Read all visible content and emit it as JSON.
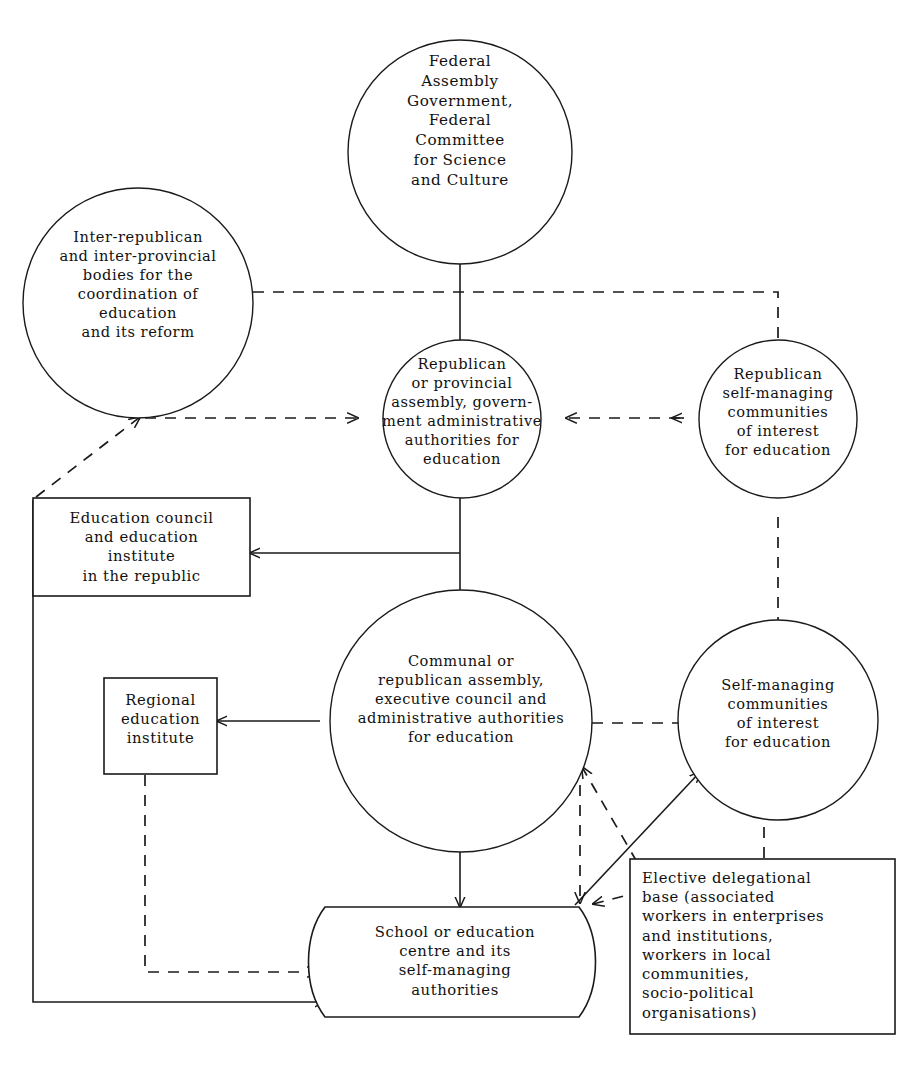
{
  "diagram": {
    "nodes": [
      {
        "id": "federal",
        "name": "federal-assembly-node",
        "shape": "circle",
        "text": "Federal\nAssembly\nGovernment,\nFederal\nCommittee\nfor Science\nand Culture"
      },
      {
        "id": "interrepublican",
        "name": "inter-republican-bodies-node",
        "shape": "circle",
        "text": "Inter-republican\nand inter-provincial\nbodies for the\ncoordination of\neducation\nand its reform"
      },
      {
        "id": "republican-assembly",
        "name": "republican-provincial-assembly-node",
        "shape": "circle",
        "text": "Republican\nor provincial\nassembly, govern-\nment administrative\nauthorities for\neducation"
      },
      {
        "id": "republican-communities",
        "name": "republican-self-managing-communities-node",
        "shape": "circle",
        "text": "Republican\nself-managing\ncommunities\nof interest\nfor education"
      },
      {
        "id": "education-council",
        "name": "education-council-institute-box",
        "shape": "rect",
        "text": "Education council\nand education\ninstitute\nin the republic"
      },
      {
        "id": "communal-assembly",
        "name": "communal-republican-assembly-node",
        "shape": "circle",
        "text": "Communal or\nrepublican assembly,\nexecutive council and\nadministrative authorities\nfor education"
      },
      {
        "id": "regional-institute",
        "name": "regional-education-institute-box",
        "shape": "rect",
        "text": "Regional\neducation\ninstitute"
      },
      {
        "id": "communities",
        "name": "self-managing-communities-node",
        "shape": "circle",
        "text": "Self-managing\ncommunities\nof interest\nfor education"
      },
      {
        "id": "school",
        "name": "school-education-centre-box",
        "shape": "drum",
        "text": "School or education\ncentre and its\nself-managing\nauthorities"
      },
      {
        "id": "elective-base",
        "name": "elective-delegational-base-box",
        "shape": "rect",
        "text": "Elective delegational\nbase (associated\nworkers in enterprises\nand institutions,\nworkers in local\ncommunities,\nsocio-political\norganisations)"
      }
    ],
    "edges": [
      {
        "name": "edge-federal-to-republican-assembly",
        "style": "solid",
        "arrow": "none"
      },
      {
        "name": "edge-interrepublican-to-republican-communities",
        "style": "dashed",
        "arrow": "none"
      },
      {
        "name": "edge-education-council-to-interrepublican",
        "style": "dashed",
        "arrow": "end"
      },
      {
        "name": "edge-interrepublican-to-republican-assembly",
        "style": "dashed",
        "arrow": "end"
      },
      {
        "name": "edge-republican-communities-to-republican-assembly",
        "style": "dashed",
        "arrow": "end"
      },
      {
        "name": "edge-republican-assembly-to-education-council",
        "style": "solid",
        "arrow": "end"
      },
      {
        "name": "edge-republican-assembly-to-communal-assembly",
        "style": "solid",
        "arrow": "none"
      },
      {
        "name": "edge-republican-communities-to-communities",
        "style": "dashed",
        "arrow": "none"
      },
      {
        "name": "edge-communal-assembly-to-regional-institute",
        "style": "solid",
        "arrow": "end"
      },
      {
        "name": "edge-communal-assembly-to-communities",
        "style": "dashed",
        "arrow": "none"
      },
      {
        "name": "edge-communal-assembly-to-school",
        "style": "solid",
        "arrow": "end"
      },
      {
        "name": "edge-communal-assembly-to-school-dashed",
        "style": "dashed",
        "arrow": "end"
      },
      {
        "name": "edge-regional-institute-to-school",
        "style": "dashed",
        "arrow": "end"
      },
      {
        "name": "edge-education-council-to-school",
        "style": "solid",
        "arrow": "end"
      },
      {
        "name": "edge-school-to-communities",
        "style": "solid",
        "arrow": "end"
      },
      {
        "name": "edge-elective-base-to-communal-assembly",
        "style": "dashed",
        "arrow": "end"
      },
      {
        "name": "edge-elective-base-to-communities",
        "style": "dashed",
        "arrow": "both"
      },
      {
        "name": "edge-school-to-elective-base",
        "style": "dashed",
        "arrow": "none"
      }
    ],
    "colors": {
      "line": "#1a1a1a",
      "background": "#ffffff",
      "text": "#111111"
    }
  }
}
